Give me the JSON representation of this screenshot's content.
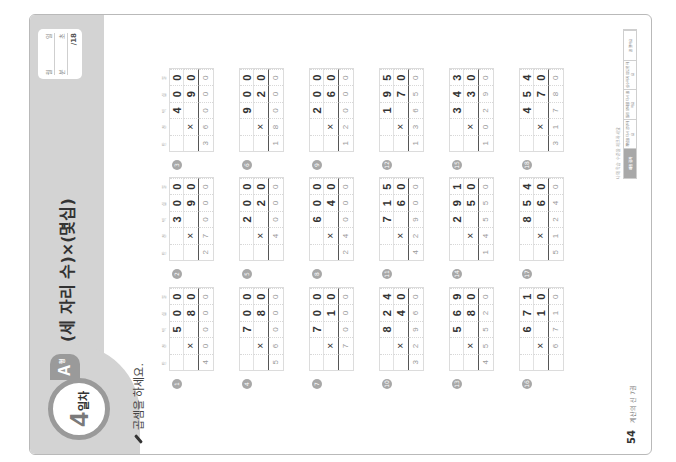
{
  "header": {
    "day_number": "4",
    "day_suffix": "일차",
    "level": "A",
    "level_suffix": "형",
    "title": "(세 자리 수)×(몇십)",
    "record": {
      "row1": [
        "월",
        "일"
      ],
      "row2": [
        "분",
        "초"
      ],
      "score": "/18"
    }
  },
  "instruction": "곱셈을 하세요.",
  "place_values": [
    "만",
    "천",
    "백",
    "십",
    "일"
  ],
  "problems": [
    {
      "num": "1",
      "top": [
        "",
        "",
        "5",
        "0",
        "0"
      ],
      "mul": [
        "",
        "×",
        "",
        "8",
        "0"
      ],
      "ans": [
        "4",
        "0",
        "0",
        "0",
        "0"
      ]
    },
    {
      "num": "2",
      "top": [
        "",
        "",
        "3",
        "0",
        "0"
      ],
      "mul": [
        "",
        "×",
        "",
        "9",
        "0"
      ],
      "ans": [
        "2",
        "7",
        "0",
        "0",
        "0"
      ]
    },
    {
      "num": "3",
      "top": [
        "",
        "",
        "4",
        "0",
        "0"
      ],
      "mul": [
        "",
        "×",
        "",
        "9",
        "0"
      ],
      "ans": [
        "3",
        "6",
        "0",
        "0",
        "0"
      ]
    },
    {
      "num": "4",
      "top": [
        "",
        "",
        "7",
        "0",
        "0"
      ],
      "mul": [
        "",
        "×",
        "",
        "8",
        "0"
      ],
      "ans": [
        "5",
        "6",
        "0",
        "0",
        "0"
      ]
    },
    {
      "num": "5",
      "top": [
        "",
        "",
        "2",
        "0",
        "0"
      ],
      "mul": [
        "",
        "×",
        "",
        "2",
        "0"
      ],
      "ans": [
        "",
        "4",
        "0",
        "0",
        "0"
      ]
    },
    {
      "num": "6",
      "top": [
        "",
        "",
        "9",
        "0",
        "0"
      ],
      "mul": [
        "",
        "×",
        "",
        "2",
        "0"
      ],
      "ans": [
        "1",
        "8",
        "0",
        "0",
        "0"
      ]
    },
    {
      "num": "7",
      "top": [
        "",
        "",
        "7",
        "0",
        "0"
      ],
      "mul": [
        "",
        "×",
        "",
        "1",
        "0"
      ],
      "ans": [
        "",
        "7",
        "0",
        "0",
        "0"
      ]
    },
    {
      "num": "8",
      "top": [
        "",
        "",
        "6",
        "0",
        "0"
      ],
      "mul": [
        "",
        "×",
        "",
        "4",
        "0"
      ],
      "ans": [
        "2",
        "4",
        "0",
        "0",
        "0"
      ]
    },
    {
      "num": "9",
      "top": [
        "",
        "",
        "2",
        "0",
        "0"
      ],
      "mul": [
        "",
        "×",
        "",
        "6",
        "0"
      ],
      "ans": [
        "1",
        "2",
        "0",
        "0",
        "0"
      ]
    },
    {
      "num": "10",
      "top": [
        "",
        "",
        "8",
        "2",
        "4"
      ],
      "mul": [
        "",
        "×",
        "",
        "4",
        "0"
      ],
      "ans": [
        "3",
        "2",
        "9",
        "6",
        "0"
      ]
    },
    {
      "num": "11",
      "top": [
        "",
        "",
        "7",
        "1",
        "5"
      ],
      "mul": [
        "",
        "×",
        "",
        "6",
        "0"
      ],
      "ans": [
        "4",
        "2",
        "9",
        "0",
        "0"
      ]
    },
    {
      "num": "12",
      "top": [
        "",
        "",
        "1",
        "9",
        "5"
      ],
      "mul": [
        "",
        "×",
        "",
        "7",
        "0"
      ],
      "ans": [
        "1",
        "3",
        "6",
        "5",
        "0"
      ]
    },
    {
      "num": "13",
      "top": [
        "",
        "",
        "5",
        "6",
        "9"
      ],
      "mul": [
        "",
        "×",
        "",
        "8",
        "0"
      ],
      "ans": [
        "4",
        "5",
        "5",
        "2",
        "0"
      ]
    },
    {
      "num": "14",
      "top": [
        "",
        "",
        "2",
        "9",
        "1"
      ],
      "mul": [
        "",
        "×",
        "",
        "5",
        "0"
      ],
      "ans": [
        "1",
        "4",
        "5",
        "5",
        "0"
      ]
    },
    {
      "num": "15",
      "top": [
        "",
        "",
        "3",
        "4",
        "3"
      ],
      "mul": [
        "",
        "×",
        "",
        "3",
        "0"
      ],
      "ans": [
        "1",
        "0",
        "2",
        "9",
        "0"
      ]
    },
    {
      "num": "16",
      "top": [
        "",
        "",
        "6",
        "7",
        "1"
      ],
      "mul": [
        "",
        "×",
        "",
        "1",
        "0"
      ],
      "ans": [
        "",
        "6",
        "7",
        "1",
        "0"
      ]
    },
    {
      "num": "17",
      "top": [
        "",
        "",
        "8",
        "5",
        "4"
      ],
      "mul": [
        "",
        "×",
        "",
        "6",
        "0"
      ],
      "ans": [
        "5",
        "1",
        "2",
        "4",
        "0"
      ]
    },
    {
      "num": "18",
      "top": [
        "",
        "",
        "4",
        "5",
        "4"
      ],
      "mul": [
        "",
        "×",
        "",
        "7",
        "0"
      ],
      "ans": [
        "3",
        "1",
        "7",
        "8",
        "0"
      ]
    }
  ],
  "footer": {
    "page_number": "54",
    "book_title": "계산의 신 7권",
    "legend_caption": "나의 학습 수준을 체크하세요",
    "legend_cells": [
      "채점 결과",
      "개념을 다시 공부해요",
      "틀린 문제를 다시 풀어요",
      "실수하지 않도록 해요",
      "잘 했어요"
    ]
  }
}
